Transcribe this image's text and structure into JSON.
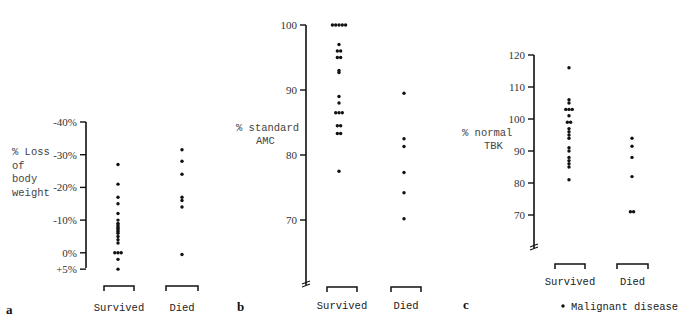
{
  "chart_data": [
    {
      "panel": "a",
      "type": "scatter",
      "title": "",
      "ylabel": "% Loss of body weight",
      "ylabel_lines": [
        "% Loss",
        "of",
        "body",
        "weight"
      ],
      "yticks": [
        "-40%",
        "-30%",
        "-20%",
        "-10%",
        "0%",
        "+5%"
      ],
      "ytick_values": [
        40,
        30,
        20,
        10,
        0,
        -5
      ],
      "ylim": [
        -5,
        40
      ],
      "categories": [
        "Survived",
        "Died"
      ],
      "series": [
        {
          "name": "Survived",
          "values": [
            27,
            21,
            17,
            15,
            12,
            10,
            9,
            8.5,
            8,
            7.5,
            7,
            6.5,
            6,
            5,
            4,
            3,
            0,
            0,
            0,
            -2,
            -5
          ]
        },
        {
          "name": "Died",
          "values": [
            31.5,
            28,
            24,
            17,
            16,
            14,
            -0.5
          ]
        }
      ],
      "grid": false
    },
    {
      "panel": "b",
      "type": "scatter",
      "title": "",
      "ylabel": "% standard AMC",
      "ylabel_lines": [
        "% standard",
        "AMC"
      ],
      "yticks": [
        "100",
        "90",
        "80",
        "70"
      ],
      "ytick_values": [
        100,
        90,
        80,
        70
      ],
      "ylim": [
        60,
        100
      ],
      "axis_break": true,
      "categories": [
        "Survived",
        "Died"
      ],
      "series": [
        {
          "name": "Survived",
          "values": [
            100,
            100,
            100,
            100,
            100,
            97,
            96,
            96,
            95,
            95,
            93,
            92.7,
            89,
            88,
            86.5,
            86.5,
            86.5,
            84.5,
            84.5,
            83.3,
            83.3,
            77.5
          ]
        },
        {
          "name": "Died",
          "values": [
            89.5,
            82.5,
            81.3,
            77.3,
            74.2,
            70.2
          ]
        }
      ],
      "grid": false
    },
    {
      "panel": "c",
      "type": "scatter",
      "title": "",
      "ylabel": "% normal TBK",
      "ylabel_lines": [
        "% normal",
        "TBK"
      ],
      "yticks": [
        "120",
        "110",
        "100",
        "90",
        "80",
        "70"
      ],
      "ytick_values": [
        120,
        110,
        100,
        90,
        80,
        70
      ],
      "ylim": [
        60,
        120
      ],
      "axis_break": true,
      "categories": [
        "Survived",
        "Died"
      ],
      "series": [
        {
          "name": "Survived",
          "values": [
            116,
            106,
            105,
            103,
            103,
            103,
            101,
            99,
            99,
            97,
            96,
            95,
            94,
            91,
            90,
            88,
            87,
            86,
            85,
            81
          ]
        },
        {
          "name": "Died",
          "values": [
            94,
            91.5,
            88,
            82,
            71,
            71
          ]
        }
      ],
      "grid": false
    }
  ],
  "legend": {
    "marker": "•",
    "label": "Malignant disease"
  },
  "panel_letters": [
    "a",
    "b",
    "c"
  ],
  "colors": {
    "ink": "#111111",
    "background": "#ffffff"
  }
}
